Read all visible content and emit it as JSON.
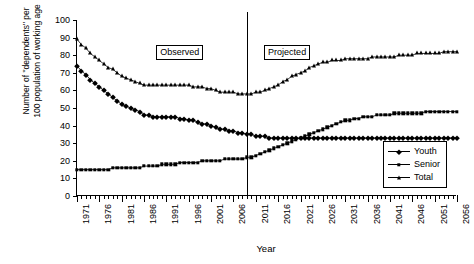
{
  "chart_data": {
    "type": "line",
    "title": "",
    "xlabel": "Year",
    "ylabel": "Number of \"dependents\" per\n100 population of working age",
    "ylim": [
      0,
      100
    ],
    "ytick_step": 10,
    "yticks": [
      0,
      10,
      20,
      30,
      40,
      50,
      60,
      70,
      80,
      90,
      100
    ],
    "xlim": [
      1971,
      2056
    ],
    "xticks_labeled": [
      1971,
      1976,
      1981,
      1986,
      1991,
      1996,
      2001,
      2006,
      2011,
      2016,
      2021,
      2026,
      2031,
      2036,
      2041,
      2046,
      2051,
      2056
    ],
    "grid": false,
    "legend_position": "bottom-right",
    "x": [
      1971,
      1972,
      1973,
      1974,
      1975,
      1976,
      1977,
      1978,
      1979,
      1980,
      1981,
      1982,
      1983,
      1984,
      1985,
      1986,
      1987,
      1988,
      1989,
      1990,
      1991,
      1992,
      1993,
      1994,
      1995,
      1996,
      1997,
      1998,
      1999,
      2000,
      2001,
      2002,
      2003,
      2004,
      2005,
      2006,
      2007,
      2008,
      2009,
      2010,
      2011,
      2012,
      2013,
      2014,
      2015,
      2016,
      2017,
      2018,
      2019,
      2020,
      2021,
      2022,
      2023,
      2024,
      2025,
      2026,
      2027,
      2028,
      2029,
      2030,
      2031,
      2032,
      2033,
      2034,
      2035,
      2036,
      2037,
      2038,
      2039,
      2040,
      2041,
      2042,
      2043,
      2044,
      2045,
      2046,
      2047,
      2048,
      2049,
      2050,
      2051,
      2052,
      2053,
      2054,
      2055,
      2056
    ],
    "series": [
      {
        "name": "Youth",
        "marker": "diamond",
        "values": [
          74,
          71,
          69,
          66,
          64,
          62,
          60,
          58,
          56,
          54,
          52,
          51,
          50,
          49,
          48,
          46,
          46,
          45,
          45,
          45,
          45,
          45,
          45,
          44,
          44,
          43,
          43,
          42,
          41,
          41,
          40,
          39,
          38,
          38,
          37,
          37,
          36,
          36,
          35,
          35,
          34,
          34,
          34,
          33,
          33,
          33,
          33,
          33,
          33,
          33,
          33,
          33,
          33,
          33,
          33,
          33,
          33,
          33,
          33,
          33,
          33,
          33,
          33,
          33,
          33,
          33,
          33,
          33,
          33,
          33,
          33,
          33,
          33,
          33,
          33,
          33,
          33,
          33,
          33,
          33,
          33,
          33,
          33,
          33,
          33,
          33
        ]
      },
      {
        "name": "Senior",
        "marker": "square",
        "values": [
          15,
          15,
          15,
          15,
          15,
          15,
          15,
          15,
          16,
          16,
          16,
          16,
          16,
          16,
          16,
          17,
          17,
          17,
          17,
          18,
          18,
          18,
          18,
          19,
          19,
          19,
          19,
          19,
          20,
          20,
          20,
          20,
          20,
          21,
          21,
          21,
          21,
          21,
          22,
          22,
          23,
          24,
          25,
          26,
          27,
          28,
          29,
          30,
          31,
          32,
          33,
          34,
          35,
          36,
          37,
          38,
          39,
          40,
          41,
          42,
          43,
          43,
          44,
          44,
          45,
          45,
          45,
          46,
          46,
          46,
          46,
          47,
          47,
          47,
          47,
          47,
          47,
          47,
          48,
          48,
          48,
          48,
          48,
          48,
          48,
          48
        ]
      },
      {
        "name": "Total",
        "marker": "triangle",
        "values": [
          89,
          86,
          84,
          81,
          79,
          77,
          75,
          73,
          72,
          70,
          68,
          67,
          66,
          65,
          64,
          63,
          63,
          63,
          63,
          63,
          63,
          63,
          63,
          63,
          63,
          63,
          62,
          62,
          62,
          61,
          61,
          60,
          59,
          59,
          59,
          59,
          58,
          58,
          58,
          58,
          59,
          59,
          60,
          61,
          62,
          63,
          65,
          66,
          68,
          69,
          70,
          71,
          73,
          74,
          75,
          76,
          76,
          77,
          77,
          77,
          78,
          78,
          78,
          78,
          78,
          78,
          79,
          79,
          79,
          79,
          79,
          79,
          80,
          80,
          80,
          80,
          81,
          81,
          81,
          81,
          81,
          81,
          82,
          82,
          82,
          82
        ]
      }
    ],
    "annotations": [
      {
        "name": "observed",
        "label": "Observed",
        "x": 1994
      },
      {
        "name": "projected",
        "label": "Projected",
        "x": 2018
      }
    ],
    "divider_x": 2009
  }
}
